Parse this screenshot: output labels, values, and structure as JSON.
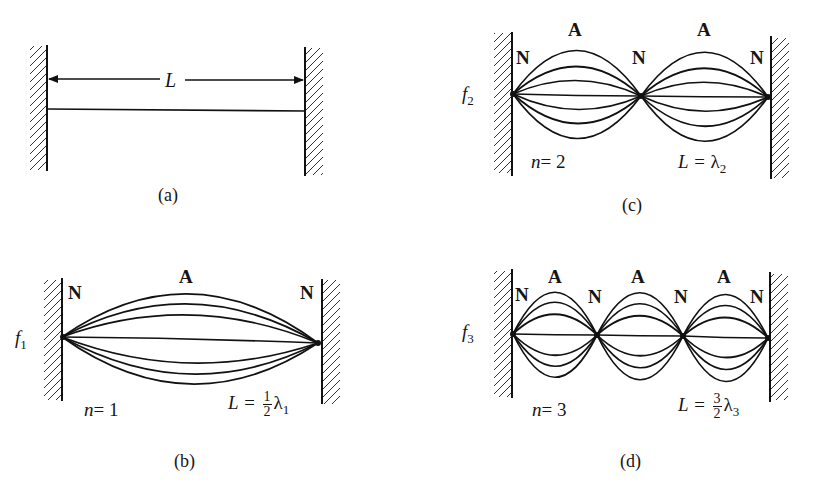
{
  "figure": {
    "panels": [
      {
        "id": "a",
        "caption": "(a)",
        "length_label": "L",
        "description": "String of length L fixed between two walls"
      },
      {
        "id": "b",
        "caption": "(b)",
        "frequency_label": "f",
        "frequency_sub": "1",
        "node_label": "N",
        "antinode_label": "A",
        "n_label": "n",
        "n_value": "= 1",
        "eq_lhs": "L =",
        "eq_num": "1",
        "eq_den": "2",
        "eq_lambda": "λ",
        "eq_sub": "1",
        "loops": 1
      },
      {
        "id": "c",
        "caption": "(c)",
        "frequency_label": "f",
        "frequency_sub": "2",
        "node_label": "N",
        "antinode_label": "A",
        "n_label": "n",
        "n_value": "= 2",
        "eq_lhs": "L =",
        "eq_lambda": "λ",
        "eq_sub": "2",
        "loops": 2
      },
      {
        "id": "d",
        "caption": "(d)",
        "frequency_label": "f",
        "frequency_sub": "3",
        "node_label": "N",
        "antinode_label": "A",
        "n_label": "n",
        "n_value": "= 3",
        "eq_lhs": "L =",
        "eq_num": "3",
        "eq_den": "2",
        "eq_lambda": "λ",
        "eq_sub": "3",
        "loops": 3
      }
    ]
  }
}
